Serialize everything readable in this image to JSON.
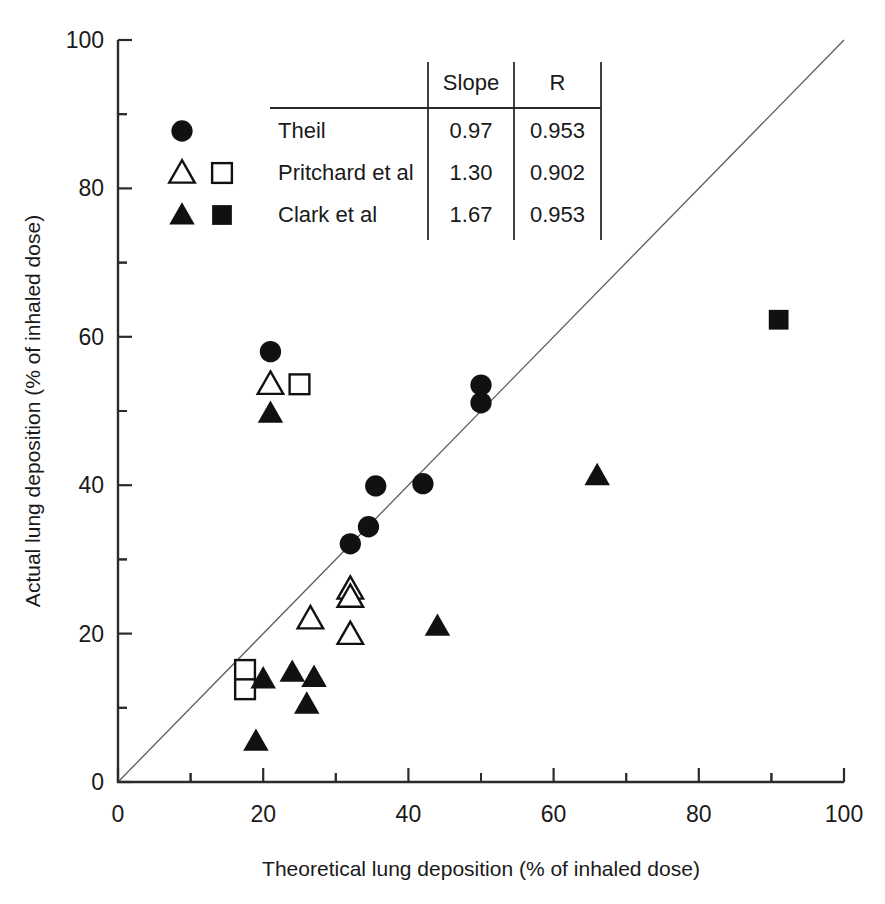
{
  "chart_data": {
    "type": "scatter",
    "title": "",
    "xlabel": "Theoretical lung deposition  (% of inhaled dose)",
    "ylabel": "Actual lung deposition  (% of inhaled dose)",
    "xlim": [
      0,
      100
    ],
    "ylim": [
      0,
      100
    ],
    "xticks": [
      0,
      20,
      40,
      60,
      80,
      100
    ],
    "yticks": [
      0,
      20,
      40,
      60,
      80,
      100
    ],
    "xtick_labels": [
      "0",
      "20",
      "40",
      "60",
      "80",
      "100"
    ],
    "ytick_labels": [
      "0",
      "20",
      "40",
      "60",
      "80",
      "100"
    ],
    "minor_tick_interval": 10,
    "grid": false,
    "legend_position": "upper-left-inside",
    "reference_line": {
      "name": "identity-line",
      "from": [
        0,
        0
      ],
      "to": [
        100,
        100
      ],
      "description": "line of identity (y = x)"
    },
    "series": [
      {
        "name": "Theil",
        "marker": "filled-circle",
        "color": "#111111",
        "points": [
          [
            21.0,
            58.0
          ],
          [
            35.5,
            39.9
          ],
          [
            32.0,
            32.1
          ],
          [
            34.5,
            34.4
          ],
          [
            42.0,
            40.2
          ],
          [
            50.0,
            53.5
          ],
          [
            50.0,
            51.1
          ]
        ]
      },
      {
        "name": "Pritchard et al",
        "marker": "open-triangle",
        "color": "#111111",
        "points": [
          [
            21.0,
            53.6
          ],
          [
            32.0,
            26.0
          ],
          [
            32.0,
            24.9
          ],
          [
            26.5,
            22.0
          ],
          [
            32.0,
            19.9
          ]
        ]
      },
      {
        "name": "Pritchard et al",
        "marker": "open-square",
        "color": "#111111",
        "points": [
          [
            25.0,
            53.6
          ],
          [
            17.5,
            15.1
          ],
          [
            17.5,
            12.5
          ]
        ]
      },
      {
        "name": "Clark et al",
        "marker": "filled-triangle",
        "color": "#111111",
        "points": [
          [
            21.0,
            49.7
          ],
          [
            66.0,
            41.3
          ],
          [
            44.0,
            21.0
          ],
          [
            20.0,
            13.9
          ],
          [
            24.0,
            14.8
          ],
          [
            27.0,
            14.1
          ],
          [
            26.0,
            10.5
          ],
          [
            19.0,
            5.5
          ]
        ]
      },
      {
        "name": "Clark et al",
        "marker": "filled-square",
        "color": "#111111",
        "points": [
          [
            91.0,
            62.3
          ]
        ]
      }
    ]
  },
  "legend": {
    "header": {
      "name_col": "",
      "slope_col": "Slope",
      "r_col": "R"
    },
    "rows": [
      {
        "markers": [
          "filled-circle"
        ],
        "label": "Theil",
        "slope": "0.97",
        "r": "0.953"
      },
      {
        "markers": [
          "open-triangle",
          "open-square"
        ],
        "label": "Pritchard et al",
        "slope": "1.30",
        "r": "0.902"
      },
      {
        "markers": [
          "filled-triangle",
          "filled-square"
        ],
        "label": "Clark et al",
        "slope": "1.67",
        "r": "0.953"
      }
    ]
  },
  "colors": {
    "marker": "#111111",
    "axis": "#2b2b2b",
    "identity_line": "#5c5c5c",
    "background": "#ffffff"
  }
}
